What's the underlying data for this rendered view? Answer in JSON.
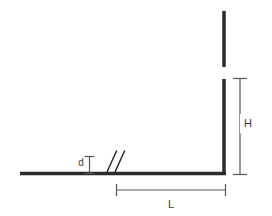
{
  "figure": {
    "type": "engineering-dimension-diagram",
    "background_color": "#ffffff",
    "profile_color": "#2b2b2b",
    "dimension_color": "#555555",
    "label_color": "#3c3c3c"
  },
  "labels": {
    "height": "H",
    "length": "L",
    "thickness": "d"
  },
  "geometry": {
    "horizontal_member": {
      "x1": 20,
      "y1": 173.5,
      "x2": 226,
      "y2": 173.5,
      "stroke_width": 3.5
    },
    "vertical_member_lower": {
      "x1": 224,
      "y1": 79,
      "x2": 224,
      "y2": 175,
      "stroke_width": 3.5
    },
    "vertical_member_upper": {
      "x1": 224,
      "y1": 11,
      "x2": 224,
      "y2": 67,
      "stroke_width": 3.5
    },
    "break_symbol": {
      "line1": {
        "x1": 107,
        "y1": 172,
        "x2": 116,
        "y2": 151
      },
      "line2": {
        "x1": 115,
        "y1": 172,
        "x2": 124,
        "y2": 151
      },
      "stroke_width": 1.4
    }
  },
  "dimensions": {
    "H": {
      "label": "H",
      "axis": "vertical",
      "line_x": 240,
      "y_top": 78,
      "y_bottom": 175,
      "cap_half_width": 7,
      "label_x": 247,
      "label_y": 123
    },
    "L": {
      "label": "L",
      "axis": "horizontal",
      "line_y": 190,
      "x_left": 116,
      "x_right": 226,
      "cap_half_height": 6,
      "label_x": 171,
      "label_y": 204
    },
    "d": {
      "label": "d",
      "axis": "vertical",
      "line_x": 89,
      "y_top": 156,
      "y_bottom": 174,
      "cap_half_width": 5,
      "label_x": 81,
      "label_y": 162
    }
  }
}
